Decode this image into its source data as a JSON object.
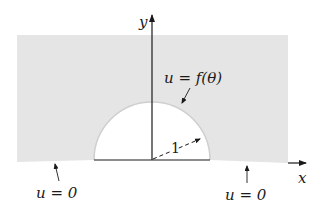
{
  "diagram": {
    "colors": {
      "region_fill": "#e5e5e5",
      "arc_stroke": "#c8c8c8",
      "axis": "#1a1a1a",
      "background": "#ffffff"
    },
    "axes": {
      "x_label": "x",
      "y_label": "y"
    },
    "labels": {
      "boundary_arc": "u = f(θ)",
      "boundary_left": "u = 0",
      "boundary_right": "u = 0",
      "radius": "1"
    }
  }
}
